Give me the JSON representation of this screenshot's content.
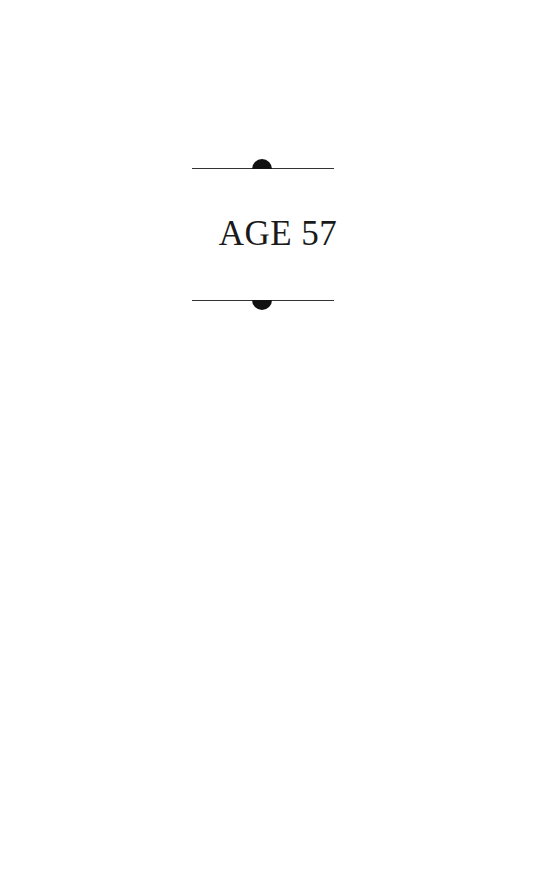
{
  "page": {
    "heading": "AGE 57",
    "ornaments": {
      "top": "rule-with-upper-semicircle",
      "bottom": "rule-with-lower-semicircle"
    }
  }
}
